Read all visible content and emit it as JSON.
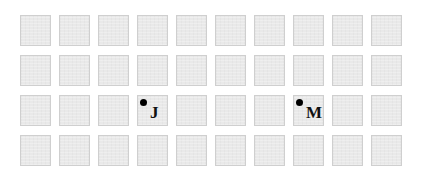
{
  "grid": {
    "rows": 4,
    "cols": 10,
    "cell_color": "#e9e9e9",
    "border_color": "#cfcfcf"
  },
  "markers": [
    {
      "row": 2,
      "col": 3,
      "label": "J"
    },
    {
      "row": 2,
      "col": 7,
      "label": "M"
    }
  ]
}
